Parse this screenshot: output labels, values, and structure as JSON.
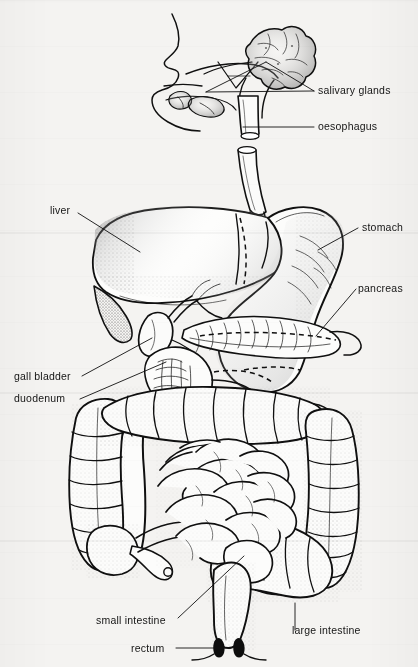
{
  "figure": {
    "kind": "labelled anatomical line drawing",
    "background_color": "#f4f3f1",
    "ink_color": "#101010"
  },
  "labels": [
    {
      "id": "salivary-glands",
      "text": "salivary glands",
      "x": 318,
      "y": 94,
      "anchor": "start"
    },
    {
      "id": "oesophagus",
      "text": "oesophagus",
      "x": 318,
      "y": 130,
      "anchor": "start"
    },
    {
      "id": "stomach",
      "text": "stomach",
      "x": 362,
      "y": 231,
      "anchor": "start"
    },
    {
      "id": "pancreas",
      "text": "pancreas",
      "x": 358,
      "y": 292,
      "anchor": "start"
    },
    {
      "id": "liver",
      "text": "liver",
      "x": 50,
      "y": 214,
      "anchor": "start"
    },
    {
      "id": "gall-bladder",
      "text": "gall bladder",
      "x": 14,
      "y": 380,
      "anchor": "start"
    },
    {
      "id": "duodenum",
      "text": "duodenum",
      "x": 14,
      "y": 402,
      "anchor": "start"
    },
    {
      "id": "small-intestine",
      "text": "small intestine",
      "x": 96,
      "y": 624,
      "anchor": "start"
    },
    {
      "id": "rectum",
      "text": "rectum",
      "x": 131,
      "y": 652,
      "anchor": "start"
    },
    {
      "id": "large-intestine",
      "text": "large intestine",
      "x": 292,
      "y": 634,
      "anchor": "start"
    }
  ],
  "organs": [
    "head and mouth profile",
    "salivary glands",
    "oesophagus",
    "liver",
    "gall bladder",
    "stomach",
    "pancreas",
    "duodenum",
    "small intestine",
    "large intestine",
    "appendix",
    "rectum"
  ]
}
